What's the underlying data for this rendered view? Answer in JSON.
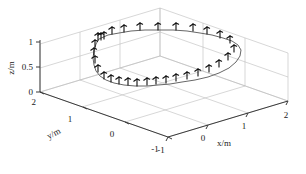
{
  "figure": {
    "type": "3d-trajectory-plot",
    "background": "#ffffff",
    "grid_color": "#b9b9b9",
    "axis_color": "#3a3a3a",
    "curve_color": "#4a4a4a",
    "marker_color": "#0d0d0d"
  },
  "axes": {
    "x": {
      "title": "x/m",
      "ticks": [
        "-1",
        "0",
        "1",
        "2"
      ],
      "values": [
        -1,
        0,
        1,
        2
      ],
      "range": [
        -1.5,
        2
      ]
    },
    "y": {
      "title": "y/m",
      "ticks": [
        "2",
        "1",
        "0",
        "-1"
      ],
      "values": [
        2,
        1,
        0,
        -1
      ],
      "range": [
        -1.5,
        2
      ]
    },
    "z": {
      "title": "z/m",
      "ticks": [
        "1",
        "0.5",
        "0"
      ],
      "values": [
        1,
        0.5,
        0
      ],
      "range": [
        0,
        1.2
      ]
    }
  },
  "chart_data": {
    "type": "line",
    "title": "",
    "xlabel": "x/m",
    "ylabel": "y/m",
    "zlabel": "z/m",
    "xlim": [
      -1.5,
      2
    ],
    "ylim": [
      -1.5,
      2
    ],
    "zlim": [
      0,
      1.2
    ],
    "grid": true,
    "legend": "none",
    "series": [
      {
        "name": "trajectory",
        "closed_loop": true,
        "points_screen": [
          [
            99,
            39
          ],
          [
            96,
            44
          ],
          [
            94,
            51
          ],
          [
            93,
            58
          ],
          [
            94,
            65
          ],
          [
            96,
            71
          ],
          [
            100,
            76
          ],
          [
            106,
            80
          ],
          [
            114,
            83
          ],
          [
            124,
            85
          ],
          [
            135,
            86
          ],
          [
            147,
            86
          ],
          [
            158,
            85
          ],
          [
            170,
            84
          ],
          [
            182,
            82
          ],
          [
            195,
            80
          ],
          [
            208,
            77
          ],
          [
            219,
            73
          ],
          [
            229,
            68
          ],
          [
            236,
            62
          ],
          [
            240,
            56
          ],
          [
            241,
            50
          ],
          [
            238,
            45
          ],
          [
            232,
            41
          ],
          [
            223,
            38
          ],
          [
            212,
            35
          ],
          [
            200,
            33
          ],
          [
            187,
            31
          ],
          [
            173,
            30
          ],
          [
            159,
            30
          ],
          [
            145,
            30
          ],
          [
            131,
            31
          ],
          [
            119,
            33
          ],
          [
            108,
            35
          ],
          [
            99,
            39
          ]
        ]
      }
    ],
    "markers": {
      "name": "pose-frames",
      "description": "coordinate-frame triads along trajectory",
      "count": 28,
      "positions_screen": [
        [
          98,
          40
        ],
        [
          101,
          40
        ],
        [
          104,
          39
        ],
        [
          95,
          47
        ],
        [
          94,
          55
        ],
        [
          95,
          63
        ],
        [
          98,
          72
        ],
        [
          104,
          79
        ],
        [
          111,
          82
        ],
        [
          119,
          84
        ],
        [
          128,
          85
        ],
        [
          137,
          86
        ],
        [
          147,
          85
        ],
        [
          156,
          84
        ],
        [
          166,
          83
        ],
        [
          176,
          81
        ],
        [
          187,
          79
        ],
        [
          198,
          76
        ],
        [
          209,
          72
        ],
        [
          219,
          67
        ],
        [
          228,
          60
        ],
        [
          234,
          52
        ],
        [
          230,
          43
        ],
        [
          220,
          38
        ],
        [
          207,
          34
        ],
        [
          193,
          31
        ],
        [
          176,
          30
        ],
        [
          158,
          30
        ],
        [
          140,
          30
        ],
        [
          124,
          32
        ],
        [
          112,
          34
        ]
      ]
    }
  }
}
